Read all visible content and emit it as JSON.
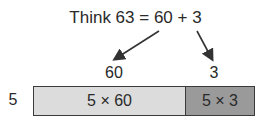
{
  "title": "Think 63 = 60 + 3",
  "parts": [
    {
      "label": "60",
      "cell": "5 × 60",
      "color": "#dcdcdc"
    },
    {
      "label": "3",
      "cell": "5 × 3",
      "color": "#9a9a9a"
    }
  ],
  "side_label": "5"
}
